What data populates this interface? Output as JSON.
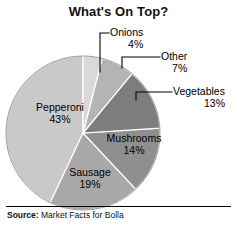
{
  "chart_data": {
    "type": "pie",
    "title": "What's On Top?",
    "xlabel": "",
    "ylabel": "",
    "categories": [
      "Onions",
      "Other",
      "Vegetables",
      "Mushrooms",
      "Sausage",
      "Pepperoni"
    ],
    "values": [
      4,
      7,
      13,
      14,
      19,
      43
    ],
    "value_suffix": "%",
    "start_angle_deg": 0,
    "direction": "clockwise",
    "legend": "none",
    "grid": false,
    "slices": [
      {
        "label": "Onions",
        "value": 4,
        "value_text": "4%",
        "color": "#d9d9d9",
        "label_placement": "callout-outside"
      },
      {
        "label": "Other",
        "value": 7,
        "value_text": "7%",
        "color": "#b4b4b4",
        "label_placement": "callout-outside"
      },
      {
        "label": "Vegetables",
        "value": 13,
        "value_text": "13%",
        "color": "#7d7d7d",
        "label_placement": "callout-outside"
      },
      {
        "label": "Mushrooms",
        "value": 14,
        "value_text": "14%",
        "color": "#8f8f8f",
        "label_placement": "inside"
      },
      {
        "label": "Sausage",
        "value": 19,
        "value_text": "19%",
        "color": "#a8a8a8",
        "label_placement": "inside"
      },
      {
        "label": "Pepperoni",
        "value": 43,
        "value_text": "43%",
        "color": "#c9c9c9",
        "label_placement": "inside"
      }
    ]
  },
  "chart": {
    "title": "What's On Top?",
    "separator_color": "#ffffff",
    "outline_color": "#9a9a9a"
  },
  "callouts": {
    "onions": {
      "label": "Onions",
      "value_text": "4%"
    },
    "other": {
      "label": "Other",
      "value_text": "7%"
    },
    "vegetables": {
      "label": "Vegetables",
      "value_text": "13%"
    }
  },
  "inside_labels": {
    "pepperoni": {
      "label": "Pepperoni",
      "value_text": "43%"
    },
    "mushrooms": {
      "label": "Mushrooms",
      "value_text": "14%"
    },
    "sausage": {
      "label": "Sausage",
      "value_text": "19%"
    }
  },
  "source": {
    "label": "Source:",
    "text": " Market Facts for Bolla"
  }
}
